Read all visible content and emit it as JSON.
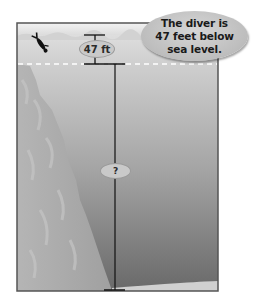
{
  "diagram": {
    "callout": {
      "text": "The diver is\n47 feet below\nsea level."
    },
    "measurements": {
      "diver_depth_label": "47 ft",
      "unknown_depth_label": "?"
    },
    "elements": {
      "sea_level_line": "dashed",
      "diver_icon": "diver-icon",
      "cliff": "underwater-cliff",
      "sea_floor": "sea-floor"
    },
    "colors": {
      "frame": "#555555",
      "water_top": "#d8d8d8",
      "water_bottom": "#6e6e6e",
      "cliff": "#a9a9a9",
      "line": "#111111",
      "callout_fill": "#c2c2c2"
    }
  }
}
